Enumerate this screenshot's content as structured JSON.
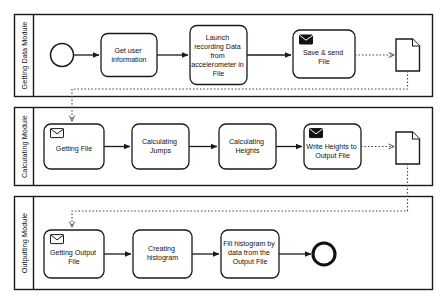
{
  "diagram": {
    "type": "bpmn-collaboration",
    "colors": {
      "stroke": "#1a1a1a",
      "fill": "#ffffff",
      "message_flow": "#4a4a4a",
      "text": "#111111"
    }
  },
  "pools": [
    {
      "id": "getting-data-module",
      "label": "Getting Data Module",
      "nodes": [
        {
          "id": "start-event",
          "type": "start-event",
          "label": ""
        },
        {
          "id": "get-user-information",
          "type": "task",
          "label": "Get user information"
        },
        {
          "id": "launch-recording",
          "type": "task",
          "label": "Launch recording Data from accelerometer in File"
        },
        {
          "id": "save-send-file",
          "type": "send-task",
          "label": "Save & send File",
          "icon": "envelope-filled-icon"
        },
        {
          "id": "data-object-file",
          "type": "data-object",
          "label": ""
        }
      ]
    },
    {
      "id": "calculating-module",
      "label": "Calculating Module",
      "nodes": [
        {
          "id": "getting-file",
          "type": "receive-task",
          "label": "Getting File",
          "icon": "envelope-open-icon"
        },
        {
          "id": "calculating-jumps",
          "type": "task",
          "label": "Calculating Jumps"
        },
        {
          "id": "calculating-heights",
          "type": "task",
          "label": "Calculating Heights"
        },
        {
          "id": "write-heights-output",
          "type": "send-task",
          "label": "Write Heights to Output File",
          "icon": "envelope-filled-icon"
        },
        {
          "id": "data-object-output-file",
          "type": "data-object",
          "label": ""
        }
      ]
    },
    {
      "id": "outputting-module",
      "label": "Outputting Module",
      "nodes": [
        {
          "id": "getting-output-file",
          "type": "receive-task",
          "label": "Getting Output File",
          "icon": "envelope-open-icon"
        },
        {
          "id": "creating-histogram",
          "type": "task",
          "label": "Creating histogram"
        },
        {
          "id": "fill-histogram",
          "type": "task",
          "label": "Fill histogram by data from the Output File"
        },
        {
          "id": "end-event",
          "type": "end-event",
          "label": ""
        }
      ]
    }
  ],
  "flows": {
    "sequence": [
      {
        "from": "start-event",
        "to": "get-user-information"
      },
      {
        "from": "get-user-information",
        "to": "launch-recording"
      },
      {
        "from": "launch-recording",
        "to": "save-send-file"
      },
      {
        "from": "getting-file",
        "to": "calculating-jumps"
      },
      {
        "from": "calculating-jumps",
        "to": "calculating-heights"
      },
      {
        "from": "calculating-heights",
        "to": "write-heights-output"
      },
      {
        "from": "getting-output-file",
        "to": "creating-histogram"
      },
      {
        "from": "creating-histogram",
        "to": "fill-histogram"
      },
      {
        "from": "fill-histogram",
        "to": "end-event"
      }
    ],
    "message": [
      {
        "from": "save-send-file",
        "to": "data-object-file"
      },
      {
        "from": "data-object-file",
        "to": "getting-file"
      },
      {
        "from": "write-heights-output",
        "to": "data-object-output-file"
      },
      {
        "from": "data-object-output-file",
        "to": "getting-output-file"
      }
    ]
  }
}
